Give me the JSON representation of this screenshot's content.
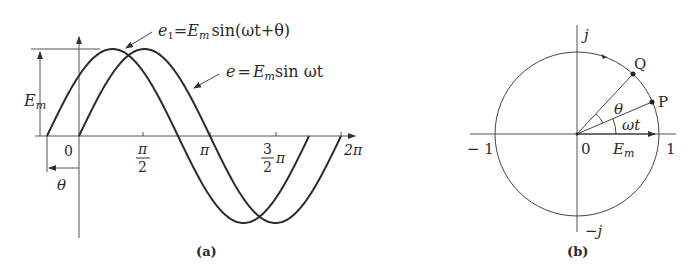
{
  "figure_a": {
    "caption": "(a)",
    "curve_e1_label": {
      "e": "e",
      "sub": "1",
      "eq": "=",
      "E": "E",
      "Esub": "m",
      "rest": "sin(ωt+θ)"
    },
    "curve_e_label": {
      "e": "e",
      "eq": "=",
      "E": "E",
      "Esub": "m",
      "rest": "sin ωt"
    },
    "amplitude_label": {
      "E": "E",
      "sub": "m"
    },
    "phase_label": "θ",
    "x_ticks": {
      "zero": "0",
      "half_pi_num": "π",
      "half_pi_den": "2",
      "pi": "π",
      "three_half_num": "3",
      "three_half_den": "2",
      "three_half_pi": "π",
      "two_pi": "2π"
    }
  },
  "figure_b": {
    "caption": "(b)",
    "axis_j": "j",
    "axis_neg_j": "−j",
    "axis_neg_one": "− 1",
    "axis_one": "1",
    "origin": "0",
    "point_p": "P",
    "point_q": "Q",
    "angle_theta": "θ",
    "angle_wt": "ωt",
    "phasor_label": {
      "E": "E",
      "sub": "m"
    }
  },
  "colors": {
    "curve": "#2b2b2b",
    "axis": "#555555",
    "text": "#2a2a2a"
  }
}
